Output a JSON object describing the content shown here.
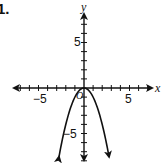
{
  "problem_number": "1.",
  "chart_data": {
    "type": "line",
    "title": "",
    "function": "y = -x^2",
    "xlabel": "x",
    "ylabel": "y",
    "origin_label": "O",
    "xlim": [
      -8,
      7.5
    ],
    "ylim": [
      -8.5,
      9.5
    ],
    "x_ticks": [
      -7,
      -6,
      -5,
      -4,
      -3,
      -2,
      -1,
      1,
      2,
      3,
      4,
      5,
      6,
      7
    ],
    "y_ticks": [
      -8,
      -7,
      -6,
      -5,
      -4,
      -3,
      -2,
      -1,
      1,
      2,
      3,
      4,
      5,
      6,
      7
    ],
    "x_tick_labels": {
      "-5": "−5",
      "5": "5"
    },
    "y_tick_labels": {
      "5": "5",
      "-5": "−5"
    },
    "series": [
      {
        "name": "parabola",
        "x": [
          -2.75,
          -2,
          -1,
          0,
          1,
          2,
          2.75
        ],
        "y": [
          -7.56,
          -4,
          -1,
          0,
          -1,
          -4,
          -7.56
        ],
        "arrows_at_ends": true
      }
    ],
    "vertex": [
      0,
      0
    ],
    "grid": false,
    "legend": "none"
  },
  "labels": {
    "x_axis": "x",
    "y_axis": "y",
    "origin": "O",
    "x_neg5": "−5",
    "x_pos5": "5",
    "y_pos5": "5",
    "y_neg5": "−5"
  }
}
